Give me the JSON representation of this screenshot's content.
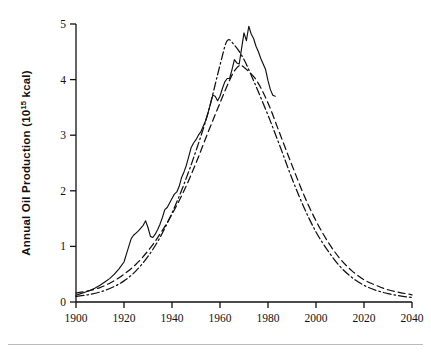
{
  "figure": {
    "background_color": "#ffffff",
    "ink_color": "#111111",
    "footer_rule_color": "#b9b9b9"
  },
  "axes": {
    "y_label_main": "Annual Oil Production (10",
    "y_label_sup": "15",
    "y_label_tail": " kcal)",
    "y_label_full": "Annual Oil Production (10¹⁵ kcal)",
    "x_label": "",
    "y_ticks": [
      "0",
      "1",
      "2",
      "3",
      "4",
      "5"
    ],
    "x_ticks": [
      "1900",
      "1920",
      "1940",
      "1960",
      "1980",
      "2000",
      "2020",
      "2040"
    ]
  },
  "chart_data": {
    "type": "line",
    "title": "",
    "subtitle": "",
    "xlabel": "",
    "ylabel": "Annual Oil Production (10^15 kcal)",
    "xlim": [
      1900,
      2040
    ],
    "ylim": [
      0,
      5
    ],
    "xticks": [
      1900,
      1920,
      1940,
      1960,
      1980,
      2000,
      2020,
      2040
    ],
    "yticks": [
      0,
      1,
      2,
      3,
      4,
      5
    ],
    "grid": false,
    "legend": "none",
    "legend_position": "none",
    "annotations": [],
    "series": [
      {
        "name": "Actual annual oil production (historical record)",
        "style": "solid",
        "x": [
          1900,
          1902,
          1904,
          1906,
          1908,
          1910,
          1912,
          1914,
          1916,
          1918,
          1920,
          1921,
          1922,
          1923,
          1924,
          1925,
          1926,
          1927,
          1928,
          1929,
          1930,
          1931,
          1932,
          1933,
          1934,
          1935,
          1936,
          1937,
          1938,
          1939,
          1940,
          1941,
          1942,
          1943,
          1944,
          1945,
          1946,
          1947,
          1948,
          1949,
          1950,
          1951,
          1952,
          1953,
          1954,
          1955,
          1956,
          1957,
          1958,
          1959,
          1960,
          1961,
          1962,
          1963,
          1964,
          1965,
          1966,
          1967,
          1968,
          1969,
          1970,
          1971,
          1972,
          1973,
          1974,
          1975,
          1976,
          1977,
          1978,
          1979,
          1980,
          1981,
          1982,
          1983
        ],
        "y": [
          0.12,
          0.15,
          0.18,
          0.21,
          0.25,
          0.3,
          0.36,
          0.42,
          0.5,
          0.6,
          0.72,
          0.86,
          1.0,
          1.14,
          1.2,
          1.24,
          1.28,
          1.33,
          1.38,
          1.46,
          1.34,
          1.18,
          1.16,
          1.22,
          1.3,
          1.4,
          1.52,
          1.66,
          1.7,
          1.78,
          1.86,
          1.94,
          1.98,
          2.08,
          2.24,
          2.34,
          2.46,
          2.62,
          2.78,
          2.86,
          2.92,
          3.0,
          3.06,
          3.16,
          3.26,
          3.4,
          3.56,
          3.72,
          3.7,
          3.62,
          3.7,
          3.84,
          3.96,
          4.02,
          4.02,
          4.18,
          4.36,
          4.3,
          4.28,
          4.56,
          4.84,
          4.7,
          4.96,
          4.82,
          4.74,
          4.6,
          4.5,
          4.38,
          4.28,
          4.18,
          3.98,
          3.82,
          3.72,
          3.7
        ]
      },
      {
        "name": "Hubbert-type fitted curve (higher ultimate resource)",
        "style": "dashed",
        "peak_year": 1968,
        "peak_value": 4.25,
        "x": [
          1900,
          1905,
          1910,
          1915,
          1920,
          1925,
          1930,
          1935,
          1940,
          1945,
          1950,
          1955,
          1960,
          1965,
          1968,
          1970,
          1975,
          1980,
          1985,
          1990,
          1995,
          2000,
          2005,
          2010,
          2015,
          2020,
          2025,
          2030,
          2035,
          2040
        ],
        "y": [
          0.16,
          0.2,
          0.26,
          0.36,
          0.5,
          0.68,
          0.92,
          1.22,
          1.58,
          2.0,
          2.5,
          3.05,
          3.58,
          4.08,
          4.25,
          4.22,
          4.0,
          3.58,
          3.02,
          2.46,
          1.92,
          1.46,
          1.08,
          0.78,
          0.56,
          0.4,
          0.3,
          0.22,
          0.17,
          0.13
        ]
      },
      {
        "name": "Hubbert-type fitted curve (lower ultimate resource)",
        "style": "dash-dot",
        "peak_year": 1963,
        "peak_value": 4.7,
        "x": [
          1900,
          1905,
          1910,
          1915,
          1920,
          1925,
          1930,
          1935,
          1940,
          1945,
          1950,
          1955,
          1960,
          1963,
          1966,
          1970,
          1975,
          1980,
          1985,
          1990,
          1995,
          2000,
          2005,
          2010,
          2015,
          2020,
          2025,
          2030,
          2035,
          2040
        ],
        "y": [
          0.1,
          0.13,
          0.18,
          0.26,
          0.38,
          0.56,
          0.82,
          1.16,
          1.6,
          2.12,
          2.72,
          3.4,
          4.26,
          4.7,
          4.62,
          4.36,
          3.88,
          3.36,
          2.8,
          2.22,
          1.7,
          1.26,
          0.92,
          0.64,
          0.44,
          0.3,
          0.21,
          0.15,
          0.11,
          0.08
        ]
      }
    ]
  }
}
